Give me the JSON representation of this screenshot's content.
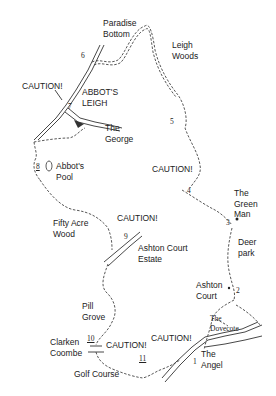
{
  "map": {
    "type": "walking-route-sketch",
    "places": {
      "paradise_bottom": "Paradise\nBottom",
      "leigh_woods": "Leigh\nWoods",
      "abbots_leigh": "ABBOT'S\nLEIGH",
      "the_george": "The\nGeorge",
      "abbots_pool": "Abbot's\nPool",
      "fifty_acre_wood": "Fifty Acre\nWood",
      "ashton_court_estate": "Ashton Court\nEstate",
      "the_green_man": "The\nGreen\nMan",
      "deer_park": "Deer\npark",
      "ashton_court": "Ashton\nCourt",
      "the_dovecote": "The\nDovecote",
      "the_angel": "The\nAngel",
      "pill_grove": "Pill\nGrove",
      "clarken_coombe": "Clarken\nCoombe",
      "golf_course": "Golf Course"
    },
    "cautions": [
      "CAUTION!",
      "CAUTION!",
      "CAUTION!",
      "CAUTION!",
      "CAUTION!"
    ],
    "waypoints": [
      "1",
      "2",
      "3",
      "4",
      "5",
      "6",
      "7",
      "8",
      "9",
      "10",
      "11"
    ]
  }
}
